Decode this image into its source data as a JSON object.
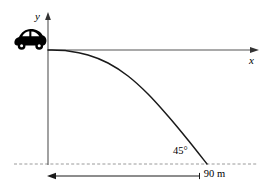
{
  "figure": {
    "background_color": "#ffffff",
    "width": 271,
    "height": 189
  },
  "axes": {
    "y_axis": {
      "label": "y",
      "orientation": "vertical",
      "has_arrowhead": true,
      "color": "#555555",
      "x_px": 48,
      "top_px": 13,
      "bottom_px": 165
    },
    "x_axis": {
      "label": "x",
      "orientation": "horizontal",
      "has_arrowhead": true,
      "color": "#555555",
      "y_px": 50,
      "left_px": 48,
      "right_px": 258
    }
  },
  "objects": {
    "vehicle": {
      "icon": "car-icon",
      "description": "black compact car silhouette at the origin",
      "color": "#000000",
      "x_px": 14,
      "y_px": 28
    }
  },
  "chart_data": {
    "type": "line",
    "xlabel": "x",
    "ylabel": "y",
    "grid": false,
    "legend": null,
    "annotations": [
      {
        "name": "impact-angle",
        "text": "45°",
        "x_px": 173,
        "y_px": 146
      },
      {
        "name": "horizontal-range",
        "text": "90 m",
        "x_px": 127,
        "y_px": 169
      }
    ],
    "series": [
      {
        "name": "trajectory",
        "style": "solid",
        "color": "#1a1a1a",
        "points_px": [
          [
            48,
            50
          ],
          [
            68,
            51
          ],
          [
            88,
            55
          ],
          [
            108,
            63
          ],
          [
            128,
            76
          ],
          [
            148,
            94
          ],
          [
            168,
            116
          ],
          [
            188,
            140
          ],
          [
            207,
            164
          ]
        ],
        "start_point_px": [
          48,
          50
        ],
        "end_point_px": [
          207,
          164
        ],
        "start_slope": "horizontal (tangent to x-axis)",
        "end_slope": "45 degrees below horizontal"
      }
    ]
  },
  "annotations": {
    "angle": {
      "label": "45°",
      "value": 45,
      "unit": "degrees",
      "meaning": "impact angle of trajectory with the ground"
    },
    "distance": {
      "label": "90 m",
      "value": 90,
      "unit": "m",
      "meaning": "horizontal range measured along the ground"
    },
    "ground_line": {
      "name": "ground-dashed-line",
      "style": "dashed",
      "color": "#9a9a9a",
      "y_px": 164,
      "left_px": 14,
      "right_px": 258
    },
    "dimension_line": {
      "name": "range-dimension-line",
      "style": "double-arrow",
      "color": "#1a1a1a",
      "y_px": 176,
      "left_px": 48,
      "right_px": 207
    }
  },
  "colors": {
    "curve": "#1a1a1a",
    "axis": "#555555",
    "dashed": "#9a9a9a",
    "dimension": "#1a1a1a",
    "vehicle": "#000000",
    "text": "#000000"
  }
}
